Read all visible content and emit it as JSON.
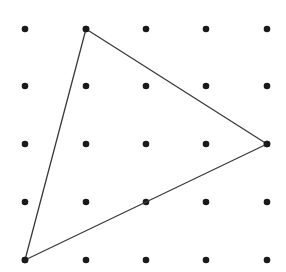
{
  "diagram": {
    "type": "dot-grid-triangle",
    "grid": {
      "columns": 5,
      "rows": 5,
      "x_positions": [
        25,
        86,
        146,
        206,
        267
      ],
      "y_positions": [
        29,
        86,
        144,
        202,
        260
      ],
      "dot_radius": 3.3,
      "dot_color": "#1a1a1a"
    },
    "triangle": {
      "vertices_grid": [
        [
          1,
          0
        ],
        [
          4,
          2
        ],
        [
          0,
          4
        ]
      ],
      "stroke_color": "#3a3a3a",
      "stroke_width": 1.3
    },
    "background": "#ffffff"
  }
}
